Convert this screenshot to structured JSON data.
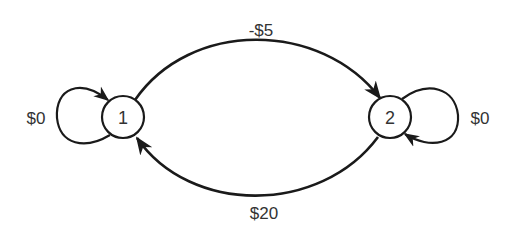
{
  "diagram": {
    "type": "state-transition",
    "nodes": [
      {
        "id": "1",
        "label": "1"
      },
      {
        "id": "2",
        "label": "2"
      }
    ],
    "edges": [
      {
        "from": "1",
        "to": "1",
        "label": "$0"
      },
      {
        "from": "1",
        "to": "2",
        "label": "-$5"
      },
      {
        "from": "2",
        "to": "1",
        "label": "$20"
      },
      {
        "from": "2",
        "to": "2",
        "label": "$0"
      }
    ],
    "colors": {
      "stroke": "#1a1a1a",
      "text": "#333333",
      "background": "#ffffff"
    }
  }
}
